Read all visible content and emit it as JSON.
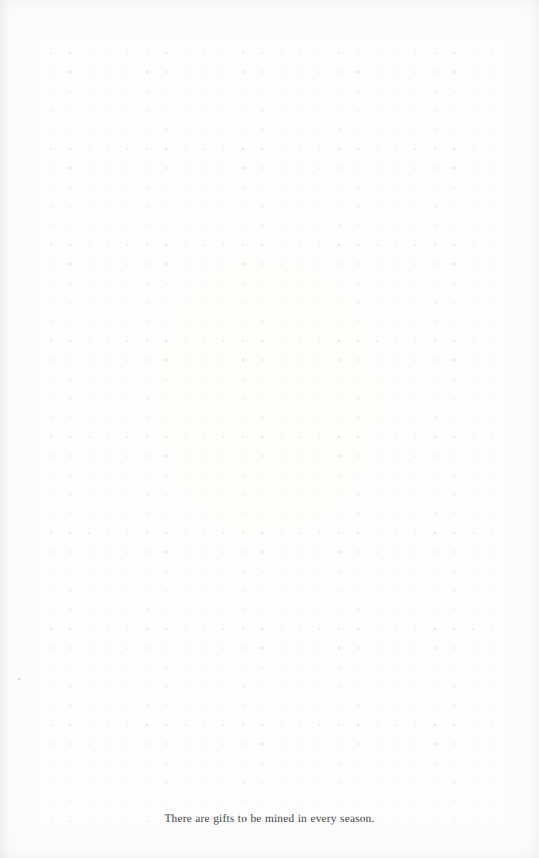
{
  "page": {
    "kind": "dot-grid-notebook-page",
    "background_color": "#fdfdfd",
    "width": 539,
    "height": 858
  },
  "grid": {
    "dot_color": "#dededf",
    "spacing_px": 19.2,
    "origin_x": 31,
    "origin_y": 33,
    "columns": 26,
    "rows": 42,
    "dot_size_px": 1.4
  },
  "caption": {
    "text": "There are gifts to be mined in every season.",
    "color": "#34343a",
    "align": "center",
    "font_size_px": 11.4
  },
  "artifacts": [
    {
      "name": "paper-speck",
      "x": 18,
      "y": 678
    }
  ]
}
